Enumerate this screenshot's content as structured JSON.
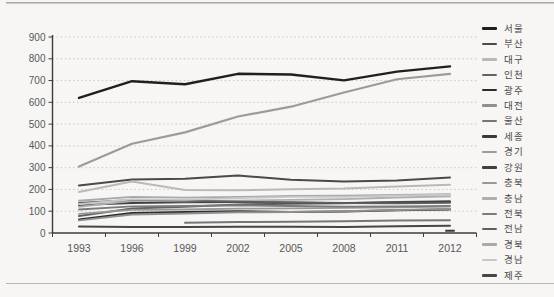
{
  "page": {
    "background": "#f7f6f4"
  },
  "chart_data": {
    "type": "line",
    "title": "",
    "xlabel": "",
    "ylabel": "",
    "x_tick_labels": [
      "1993",
      "1996",
      "1999",
      "2002",
      "2005",
      "2008",
      "2011",
      "2012"
    ],
    "ytick_labels": [
      "0",
      "100",
      "200",
      "300",
      "400",
      "500",
      "600",
      "700",
      "800",
      "900"
    ],
    "ylim": [
      0,
      900
    ],
    "ytick_step": 100,
    "grid": "horizontal-dotted",
    "legend_position": "right",
    "axis_color": "#3c3c3c",
    "grid_color": "#bcbcbc",
    "tick_label_color": "#585858",
    "series": [
      {
        "name": "서울",
        "color": "#1f1f1f",
        "width": 2.4,
        "values": [
          620,
          697,
          683,
          731,
          728,
          701,
          741,
          765
        ]
      },
      {
        "name": "부산",
        "color": "#4a4a4a",
        "width": 2.0,
        "values": [
          218,
          246,
          249,
          264,
          245,
          236,
          241,
          255
        ]
      },
      {
        "name": "대구",
        "color": "#b9b9b9",
        "width": 2.0,
        "values": [
          188,
          236,
          197,
          196,
          201,
          204,
          213,
          222
        ]
      },
      {
        "name": "인천",
        "color": "#636363",
        "width": 2.0,
        "values": [
          78,
          112,
          121,
          131,
          134,
          137,
          142,
          146
        ]
      },
      {
        "name": "광주",
        "color": "#2a2a2a",
        "width": 2.0,
        "values": [
          62,
          92,
          96,
          100,
          97,
          99,
          104,
          108
        ]
      },
      {
        "name": "대전",
        "color": "#8f8f8f",
        "width": 2.0,
        "values": [
          58,
          85,
          90,
          95,
          97,
          100,
          106,
          110
        ]
      },
      {
        "name": "울산",
        "color": "#767676",
        "width": 2.0,
        "values": [
          null,
          null,
          47,
          50,
          52,
          54,
          57,
          59
        ]
      },
      {
        "name": "세종",
        "color": "#3a3a3a",
        "width": 2.0,
        "values": [
          null,
          null,
          null,
          null,
          null,
          null,
          null,
          10
        ]
      },
      {
        "name": "경기",
        "color": "#9b9b9b",
        "width": 2.2,
        "values": [
          305,
          410,
          462,
          535,
          580,
          645,
          706,
          731
        ]
      },
      {
        "name": "강원",
        "color": "#404040",
        "width": 2.0,
        "values": [
          128,
          138,
          141,
          142,
          140,
          138,
          140,
          143
        ]
      },
      {
        "name": "충북",
        "color": "#989898",
        "width": 1.8,
        "values": [
          88,
          106,
          108,
          112,
          113,
          115,
          118,
          121
        ]
      },
      {
        "name": "충남",
        "color": "#aeaeae",
        "width": 1.8,
        "values": [
          120,
          148,
          145,
          149,
          152,
          156,
          163,
          168
        ]
      },
      {
        "name": "전북",
        "color": "#7b7b7b",
        "width": 1.8,
        "values": [
          108,
          122,
          124,
          127,
          124,
          121,
          122,
          125
        ]
      },
      {
        "name": "전남",
        "color": "#5f5f5f",
        "width": 1.8,
        "values": [
          138,
          152,
          148,
          144,
          140,
          137,
          136,
          138
        ]
      },
      {
        "name": "경북",
        "color": "#a9a9a9",
        "width": 1.8,
        "values": [
          148,
          166,
          162,
          166,
          170,
          171,
          175,
          178
        ]
      },
      {
        "name": "경남",
        "color": "#c7c7c7",
        "width": 1.8,
        "values": [
          132,
          155,
          152,
          160,
          166,
          166,
          172,
          176
        ]
      },
      {
        "name": "제주",
        "color": "#464646",
        "width": 2.0,
        "values": [
          30,
          28,
          28,
          29,
          29,
          28,
          31,
          33
        ]
      }
    ]
  }
}
